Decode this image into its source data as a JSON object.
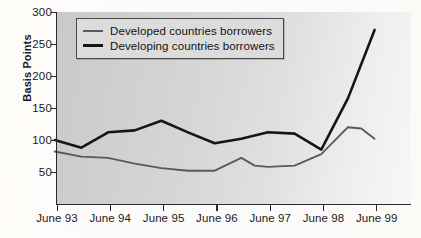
{
  "chart_data": {
    "type": "line",
    "title": "",
    "xlabel": "",
    "ylabel": "Basis Points",
    "ylim": [
      0,
      300
    ],
    "yticks": [
      50,
      100,
      150,
      200,
      250,
      300
    ],
    "categories": [
      "June 93",
      "June 94",
      "June 95",
      "June 96",
      "June 97",
      "June 98",
      "June 99"
    ],
    "x": [
      1993.5,
      1994.5,
      1995.5,
      1996.5,
      1997.5,
      1998.5,
      1999.5
    ],
    "grid": false,
    "legend_position": "top-left",
    "series": [
      {
        "name": "Developed countries borrowers",
        "color": "#5a5a5a",
        "values": [
          82,
          72,
          52,
          58,
          58,
          78,
          102
        ],
        "points": [
          {
            "x": "June 93",
            "y": 82
          },
          {
            "x": "Dec 93",
            "y": 74
          },
          {
            "x": "June 94",
            "y": 72
          },
          {
            "x": "Dec 94",
            "y": 63
          },
          {
            "x": "June 95",
            "y": 56
          },
          {
            "x": "Dec 95",
            "y": 52
          },
          {
            "x": "June 96",
            "y": 52
          },
          {
            "x": "Dec 96",
            "y": 72
          },
          {
            "x": "Mar 97",
            "y": 60
          },
          {
            "x": "June 97",
            "y": 58
          },
          {
            "x": "Dec 97",
            "y": 60
          },
          {
            "x": "June 98",
            "y": 78
          },
          {
            "x": "Dec 98",
            "y": 120
          },
          {
            "x": "Mar 99",
            "y": 118
          },
          {
            "x": "June 99",
            "y": 102
          }
        ]
      },
      {
        "name": "Developing countries borrowers",
        "color": "#161616",
        "values": [
          100,
          112,
          130,
          95,
          112,
          85,
          272
        ],
        "points": [
          {
            "x": "June 93",
            "y": 100
          },
          {
            "x": "Dec 93",
            "y": 88
          },
          {
            "x": "June 94",
            "y": 112
          },
          {
            "x": "Dec 94",
            "y": 115
          },
          {
            "x": "June 95",
            "y": 130
          },
          {
            "x": "Dec 95",
            "y": 112
          },
          {
            "x": "June 96",
            "y": 95
          },
          {
            "x": "Dec 96",
            "y": 102
          },
          {
            "x": "June 97",
            "y": 112
          },
          {
            "x": "Dec 97",
            "y": 110
          },
          {
            "x": "June 98",
            "y": 85
          },
          {
            "x": "Dec 98",
            "y": 165
          },
          {
            "x": "June 99",
            "y": 272
          }
        ]
      }
    ]
  },
  "axis": {
    "y_label": "Basis Points",
    "y_ticks": [
      "300",
      "250",
      "200",
      "150",
      "100",
      "50"
    ],
    "x_ticks": [
      "June 93",
      "June 94",
      "June 95",
      "June 96",
      "June 97",
      "June 98",
      "June 99"
    ]
  },
  "legend": {
    "items": [
      {
        "label": "Developed countries borrowers",
        "color": "#5a5a5a",
        "width": "2px"
      },
      {
        "label": "Developing countries borrowers",
        "color": "#161616",
        "width": "3px"
      }
    ]
  }
}
